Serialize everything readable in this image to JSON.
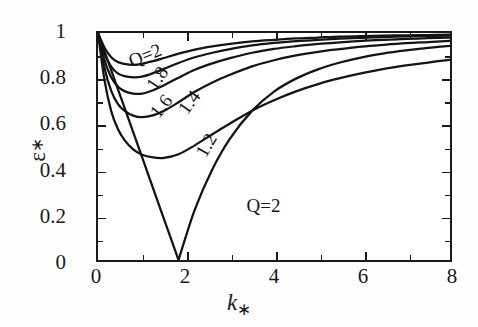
{
  "figure": {
    "background_color": "#ffffff",
    "frame_color": "#1a1a1a",
    "curve_color": "#141414"
  },
  "axes": {
    "x": {
      "title_main": "k",
      "title_sub": "∗",
      "min": 0,
      "max": 8,
      "major_ticks": [
        0,
        2,
        4,
        6,
        8
      ],
      "minor_ticks": [
        1,
        3,
        5,
        7
      ],
      "tick_labels": [
        "0",
        "2",
        "4",
        "6",
        "8"
      ]
    },
    "y": {
      "title_main": "ε",
      "title_sub": "∗",
      "min": 0,
      "max": 1,
      "major_ticks": [
        0,
        0.2,
        0.4,
        0.6,
        0.8,
        1
      ],
      "tick_labels": [
        "0",
        "0.2",
        "0.4",
        "0.6",
        "0.8",
        "1"
      ]
    }
  },
  "curve_labels": [
    {
      "text": "Q=2",
      "x": 1.05,
      "y": 0.905,
      "rotate": -22
    },
    {
      "text": "1.8",
      "x": 1.32,
      "y": 0.805,
      "rotate": -56
    },
    {
      "text": "1.6",
      "x": 1.42,
      "y": 0.685,
      "rotate": -52
    },
    {
      "text": "1.4",
      "x": 2.05,
      "y": 0.7,
      "rotate": -54
    },
    {
      "text": "1.2",
      "x": 2.42,
      "y": 0.515,
      "rotate": -60
    },
    {
      "text": "Q=2",
      "x": 3.72,
      "y": 0.255,
      "rotate": 0
    }
  ],
  "chart_data": {
    "type": "line",
    "title": "",
    "xlabel": "k∗",
    "ylabel": "ε∗",
    "xlim": [
      0,
      8
    ],
    "ylim": [
      0,
      1
    ],
    "grid": false,
    "legend": "inline curve labels",
    "x": [
      0,
      0.15,
      0.3,
      0.45,
      0.6,
      0.8,
      1.0,
      1.25,
      1.5,
      1.83,
      2.2,
      2.6,
      3.0,
      3.5,
      4.0,
      4.5,
      5.0,
      5.5,
      6.0,
      6.5,
      7.0,
      7.5,
      8.0
    ],
    "series": [
      {
        "name": "Q=2 (upper branch)",
        "label": "Q=2",
        "minimum": {
          "x": 0.82,
          "y": 0.86
        },
        "values": [
          1.0,
          0.935,
          0.893,
          0.872,
          0.864,
          0.86,
          0.864,
          0.876,
          0.89,
          0.909,
          0.927,
          0.941,
          0.952,
          0.963,
          0.97,
          0.976,
          0.98,
          0.984,
          0.986,
          0.988,
          0.99,
          0.991,
          0.993
        ]
      },
      {
        "name": "Q=1.8",
        "label": "1.8",
        "minimum": {
          "x": 0.92,
          "y": 0.805
        },
        "values": [
          1.0,
          0.908,
          0.852,
          0.822,
          0.81,
          0.805,
          0.808,
          0.823,
          0.842,
          0.868,
          0.893,
          0.913,
          0.929,
          0.945,
          0.956,
          0.964,
          0.97,
          0.975,
          0.979,
          0.982,
          0.985,
          0.987,
          0.989
        ]
      },
      {
        "name": "Q=1.6",
        "label": "1.6",
        "minimum": {
          "x": 1.05,
          "y": 0.73
        },
        "values": [
          1.0,
          0.88,
          0.805,
          0.764,
          0.744,
          0.733,
          0.733,
          0.748,
          0.77,
          0.803,
          0.838,
          0.866,
          0.889,
          0.913,
          0.93,
          0.942,
          0.952,
          0.959,
          0.965,
          0.97,
          0.974,
          0.977,
          0.98
        ]
      },
      {
        "name": "Q=1.4",
        "label": "1.4",
        "minimum": {
          "x": 1.2,
          "y": 0.625
        },
        "values": [
          1.0,
          0.845,
          0.745,
          0.688,
          0.658,
          0.636,
          0.629,
          0.637,
          0.657,
          0.695,
          0.741,
          0.782,
          0.816,
          0.853,
          0.88,
          0.901,
          0.917,
          0.929,
          0.94,
          0.948,
          0.955,
          0.96,
          0.965
        ]
      },
      {
        "name": "Q=1.2",
        "label": "1.2",
        "minimum": {
          "x": 1.45,
          "y": 0.45
        },
        "values": [
          1.0,
          0.79,
          0.656,
          0.578,
          0.529,
          0.487,
          0.464,
          0.452,
          0.45,
          0.466,
          0.505,
          0.554,
          0.601,
          0.658,
          0.704,
          0.743,
          0.775,
          0.801,
          0.823,
          0.842,
          0.857,
          0.87,
          0.882
        ]
      },
      {
        "name": "Q=2 (lower V branch)",
        "label": "Q=2",
        "minimum": {
          "x": 1.83,
          "y": 0.0
        },
        "values": [
          1.0,
          0.918,
          0.836,
          0.754,
          0.672,
          0.563,
          0.454,
          0.317,
          0.18,
          0.0,
          0.222,
          0.4,
          0.535,
          0.657,
          0.742,
          0.799,
          0.84,
          0.87,
          0.893,
          0.91,
          0.923,
          0.934,
          0.943
        ]
      }
    ]
  }
}
